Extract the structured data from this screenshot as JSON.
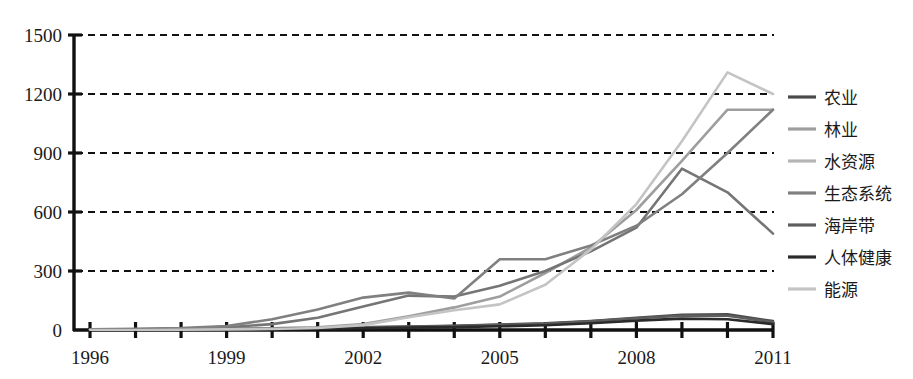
{
  "chart_data": {
    "type": "line",
    "title": "",
    "xlabel": "",
    "ylabel": "",
    "xlim": [
      1996,
      2011
    ],
    "ylim": [
      0,
      1500
    ],
    "grid": true,
    "grid_axis": "y",
    "legend_position": "right",
    "y_ticks": [
      0,
      300,
      600,
      900,
      1200,
      1500
    ],
    "y_tick_labels": [
      "0",
      "300",
      "600",
      "900",
      "1200",
      "1500"
    ],
    "x_ticks": [
      1996,
      1997,
      1998,
      1999,
      2000,
      2001,
      2002,
      2003,
      2004,
      2005,
      2006,
      2007,
      2008,
      2009,
      2010,
      2011
    ],
    "x_tick_labels_shown": [
      "1996",
      "1999",
      "2002",
      "2005",
      "2008",
      "2011"
    ],
    "x": [
      1996,
      1997,
      1998,
      1999,
      2000,
      2001,
      2002,
      2003,
      2004,
      2005,
      2006,
      2007,
      2008,
      2009,
      2010,
      2011
    ],
    "series": [
      {
        "name": "农业",
        "color": "#4a4a4a",
        "values": [
          2,
          3,
          4,
          6,
          8,
          10,
          14,
          18,
          22,
          28,
          34,
          46,
          62,
          78,
          80,
          45
        ]
      },
      {
        "name": "林业",
        "color": "#9e9e9e",
        "values": [
          1,
          2,
          3,
          4,
          8,
          14,
          30,
          70,
          115,
          170,
          290,
          420,
          610,
          860,
          1120,
          1120
        ]
      },
      {
        "name": "水资源",
        "color": "#757575",
        "values": [
          2,
          4,
          7,
          14,
          30,
          62,
          120,
          175,
          170,
          225,
          300,
          400,
          520,
          820,
          700,
          490
        ]
      },
      {
        "name": "生态系统",
        "color": "#808080",
        "values": [
          3,
          6,
          10,
          20,
          55,
          105,
          165,
          190,
          160,
          360,
          360,
          430,
          530,
          690,
          900,
          1120
        ]
      },
      {
        "name": "海岸带",
        "color": "#5e5e5e",
        "values": [
          1,
          2,
          3,
          4,
          6,
          9,
          13,
          17,
          20,
          26,
          32,
          44,
          60,
          72,
          72,
          40
        ]
      },
      {
        "name": "人体健康",
        "color": "#2b2b2b",
        "values": [
          1,
          1,
          2,
          3,
          4,
          6,
          9,
          12,
          15,
          19,
          24,
          34,
          48,
          58,
          55,
          30
        ]
      },
      {
        "name": "能源",
        "color": "#c4c4c4",
        "values": [
          1,
          1,
          2,
          3,
          5,
          10,
          25,
          65,
          100,
          130,
          230,
          410,
          640,
          960,
          1310,
          1200
        ]
      }
    ]
  },
  "axis": {
    "y_labels": [
      "1500",
      "1200",
      "900",
      "600",
      "300",
      "0"
    ],
    "x_labels": [
      "1996",
      "1999",
      "2002",
      "2005",
      "2008",
      "2011"
    ]
  },
  "legend": {
    "items": [
      {
        "label": "农业",
        "color": "#4a4a4a"
      },
      {
        "label": "林业",
        "color": "#9e9e9e"
      },
      {
        "label": "水资源",
        "color": "#b5b5b5"
      },
      {
        "label": "生态系统",
        "color": "#808080"
      },
      {
        "label": "海岸带",
        "color": "#5e5e5e"
      },
      {
        "label": "人体健康",
        "color": "#2b2b2b"
      },
      {
        "label": "能源",
        "color": "#c4c4c4"
      }
    ]
  }
}
